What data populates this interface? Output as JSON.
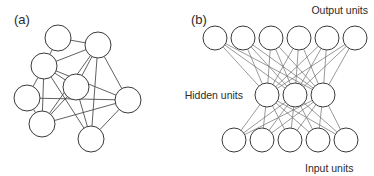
{
  "figure": {
    "width": 374,
    "height": 176,
    "background": "#ffffff",
    "stroke_color": "#3a3a3a",
    "edge_color": "#444444",
    "text_color": "#2b2b2b"
  },
  "panels": [
    {
      "key": "a",
      "label": "(a)",
      "label_x": 14,
      "label_y": 24,
      "type": "recurrent-network",
      "node_radius": 13,
      "nodes": [
        {
          "id": "a0",
          "cx": 58,
          "cy": 38
        },
        {
          "id": "a1",
          "cx": 98,
          "cy": 45
        },
        {
          "id": "a2",
          "cx": 44,
          "cy": 66
        },
        {
          "id": "a3",
          "cx": 27,
          "cy": 98
        },
        {
          "id": "a4",
          "cx": 76,
          "cy": 87
        },
        {
          "id": "a5",
          "cx": 128,
          "cy": 100
        },
        {
          "id": "a6",
          "cx": 42,
          "cy": 124
        },
        {
          "id": "a7",
          "cx": 91,
          "cy": 139
        }
      ],
      "edges": [
        {
          "from": "a0",
          "to": "a2"
        },
        {
          "from": "a0",
          "to": "a1"
        },
        {
          "from": "a1",
          "to": "a2"
        },
        {
          "from": "a1",
          "to": "a4"
        },
        {
          "from": "a1",
          "to": "a5"
        },
        {
          "from": "a1",
          "to": "a7"
        },
        {
          "from": "a1",
          "to": "a6"
        },
        {
          "from": "a2",
          "to": "a3"
        },
        {
          "from": "a2",
          "to": "a4"
        },
        {
          "from": "a2",
          "to": "a6"
        },
        {
          "from": "a2",
          "to": "a7"
        },
        {
          "from": "a2",
          "to": "a5"
        },
        {
          "from": "a3",
          "to": "a6"
        },
        {
          "from": "a3",
          "to": "a5"
        },
        {
          "from": "a4",
          "to": "a7"
        },
        {
          "from": "a4",
          "to": "a6"
        },
        {
          "from": "a5",
          "to": "a7"
        },
        {
          "from": "a6",
          "to": "a5"
        }
      ]
    },
    {
      "key": "b",
      "label": "(b)",
      "label_x": 191,
      "label_y": 24,
      "type": "feedforward-network",
      "node_radius": 12,
      "layers": [
        {
          "name": "output",
          "label": "Output units",
          "label_x": 368,
          "label_y": 14,
          "label_anchor": "end",
          "cy": 38,
          "count": 6,
          "x_start": 215,
          "x_step": 28
        },
        {
          "name": "hidden",
          "label": "Hidden units",
          "label_x": 243,
          "label_y": 99,
          "label_anchor": "end",
          "cy": 95,
          "count": 3,
          "x_start": 267,
          "x_step": 28
        },
        {
          "name": "input",
          "label": "Input units",
          "label_x": 305,
          "label_y": 172,
          "label_anchor": "start",
          "cy": 140,
          "count": 5,
          "x_start": 234,
          "x_step": 28
        }
      ],
      "connections": [
        {
          "from_layer": "hidden",
          "to_layer": "output",
          "pattern": "fully-connected"
        },
        {
          "from_layer": "input",
          "to_layer": "hidden",
          "pattern": "fully-connected"
        }
      ]
    }
  ]
}
